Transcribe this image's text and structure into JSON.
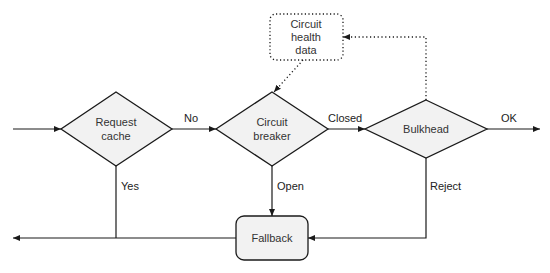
{
  "diagram": {
    "colors": {
      "stroke": "#1a1a1a",
      "node_fill": "#f2f2f2",
      "text": "#333333",
      "background": "#ffffff"
    },
    "nodes": {
      "request_cache": {
        "line1": "Request",
        "line2": "cache"
      },
      "circuit_breaker": {
        "line1": "Circuit",
        "line2": "breaker"
      },
      "bulkhead": {
        "label": "Bulkhead"
      },
      "fallback": {
        "label": "Fallback"
      },
      "health_data": {
        "line1": "Circuit",
        "line2": "health",
        "line3": "data"
      }
    },
    "edges": {
      "no": "No",
      "yes": "Yes",
      "closed": "Closed",
      "open": "Open",
      "ok": "OK",
      "reject": "Reject"
    }
  }
}
